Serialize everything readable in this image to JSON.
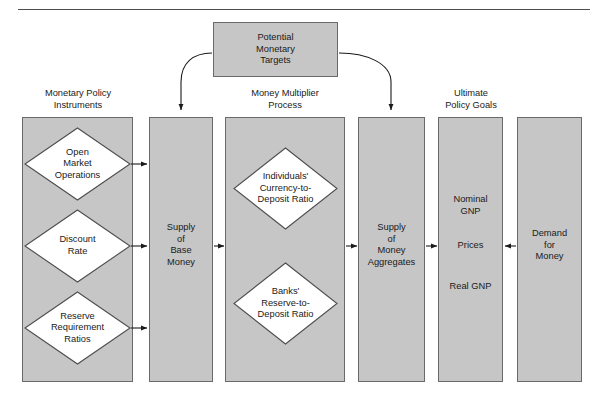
{
  "figure": {
    "type": "flow-diagram",
    "title_rule": "horizontal-rule",
    "background_color": "#ffffff",
    "box_fill_color": "#c6c6c6",
    "box_border_color": "#6a6a6a",
    "diamond_fill_color": "#ffffff",
    "text_color": "#1a1a1a"
  },
  "top_box": {
    "label": "Potential\nMonetary\nTargets"
  },
  "headers": {
    "instruments": "Monetary Policy\nInstruments",
    "multiplier": "Money Multiplier\nProcess",
    "goals": "Ultimate\nPolicy Goals"
  },
  "columns": [
    {
      "name": "monetary-policy-instruments",
      "diamonds": [
        "Open\nMarket\nOperations",
        "Discount\nRate",
        "Reserve\nRequirement\nRatios"
      ]
    },
    {
      "name": "supply-of-base-money",
      "text": "Supply\nof\nBase\nMoney"
    },
    {
      "name": "money-multiplier-process",
      "diamonds": [
        "Individuals'\nCurrency-to-\nDeposit Ratio",
        "Banks'\nReserve-to-\nDeposit Ratio"
      ]
    },
    {
      "name": "supply-of-money-aggregates",
      "text": "Supply\nof\nMoney\nAggregates"
    },
    {
      "name": "ultimate-policy-goals",
      "items": [
        "Nominal\nGNP",
        "Prices",
        "Real GNP"
      ]
    },
    {
      "name": "demand-for-money",
      "text": "Demand\nfor\nMoney"
    }
  ],
  "arrows": {
    "straight": [
      "open-market-operations-to-base-money",
      "discount-rate-to-base-money",
      "reserve-requirement-ratios-to-base-money",
      "base-money-to-multiplier",
      "multiplier-to-money-aggregates",
      "money-aggregates-to-policy-goals",
      "demand-for-money-to-policy-goals"
    ],
    "curved": [
      "potential-targets-to-base-money",
      "potential-targets-to-money-aggregates"
    ]
  }
}
